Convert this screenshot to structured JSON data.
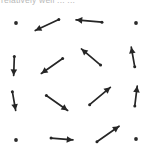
{
  "figure": {
    "title_fragment": "relatively well ... ...",
    "width": 154,
    "height": 159,
    "background_color": "#ffffff",
    "arrow_color": "#262626",
    "dot_color": "#2b2b2b",
    "caption_color": "#b9b9b9"
  },
  "chart_data": {
    "type": "scatter",
    "title": "relatively well ... ...",
    "xlabel": "",
    "ylabel": "",
    "grid": false,
    "legend": null,
    "xlim": [
      0,
      4
    ],
    "ylim": [
      0,
      4
    ],
    "columns": 4,
    "rows": 4,
    "markers": [
      {
        "id": "r1c1",
        "row": 1,
        "col": 1,
        "x": 16,
        "y": 23,
        "kind": "dot",
        "direction": "none",
        "angle_deg": null,
        "length": 0,
        "label": "stationary-point"
      },
      {
        "id": "r1c2",
        "row": 1,
        "col": 2,
        "x": 47,
        "y": 25,
        "kind": "arrow",
        "direction": "down-left",
        "angle_deg": 205,
        "length": 26,
        "label": "vector-down-left"
      },
      {
        "id": "r1c3",
        "row": 1,
        "col": 3,
        "x": 89,
        "y": 21,
        "kind": "arrow",
        "direction": "left",
        "angle_deg": 175,
        "length": 26,
        "label": "vector-left"
      },
      {
        "id": "r1c4",
        "row": 1,
        "col": 4,
        "x": 136,
        "y": 23,
        "kind": "dot",
        "direction": "none",
        "angle_deg": null,
        "length": 0,
        "label": "stationary-point"
      },
      {
        "id": "r2c1",
        "row": 2,
        "col": 1,
        "x": 14,
        "y": 66,
        "kind": "arrow",
        "direction": "down",
        "angle_deg": 268,
        "length": 19,
        "label": "vector-down"
      },
      {
        "id": "r2c2",
        "row": 2,
        "col": 2,
        "x": 52,
        "y": 66,
        "kind": "arrow",
        "direction": "down-left",
        "angle_deg": 215,
        "length": 26,
        "label": "vector-down-left"
      },
      {
        "id": "r2c3",
        "row": 2,
        "col": 3,
        "x": 91,
        "y": 57,
        "kind": "arrow",
        "direction": "up-left",
        "angle_deg": 140,
        "length": 25,
        "label": "vector-up-left"
      },
      {
        "id": "r2c4",
        "row": 2,
        "col": 4,
        "x": 133,
        "y": 57,
        "kind": "arrow",
        "direction": "up",
        "angle_deg": 100,
        "length": 20,
        "label": "vector-up"
      },
      {
        "id": "r3c1",
        "row": 3,
        "col": 1,
        "x": 14,
        "y": 101,
        "kind": "arrow",
        "direction": "down",
        "angle_deg": 280,
        "length": 19,
        "label": "vector-down"
      },
      {
        "id": "r3c2",
        "row": 3,
        "col": 2,
        "x": 57,
        "y": 103,
        "kind": "arrow",
        "direction": "down-right",
        "angle_deg": 325,
        "length": 26,
        "label": "vector-down-right"
      },
      {
        "id": "r3c3",
        "row": 3,
        "col": 3,
        "x": 100,
        "y": 96,
        "kind": "arrow",
        "direction": "up-right",
        "angle_deg": 40,
        "length": 27,
        "label": "vector-up-right"
      },
      {
        "id": "r3c4",
        "row": 3,
        "col": 4,
        "x": 136,
        "y": 96,
        "kind": "arrow",
        "direction": "up",
        "angle_deg": 83,
        "length": 20,
        "label": "vector-up"
      },
      {
        "id": "r4c1",
        "row": 4,
        "col": 1,
        "x": 16,
        "y": 140,
        "kind": "dot",
        "direction": "none",
        "angle_deg": null,
        "length": 0,
        "label": "stationary-point"
      },
      {
        "id": "r4c2",
        "row": 4,
        "col": 2,
        "x": 62,
        "y": 139,
        "kind": "arrow",
        "direction": "right",
        "angle_deg": 355,
        "length": 22,
        "label": "vector-right"
      },
      {
        "id": "r4c3",
        "row": 4,
        "col": 3,
        "x": 108,
        "y": 134,
        "kind": "arrow",
        "direction": "up-right",
        "angle_deg": 35,
        "length": 27,
        "label": "vector-up-right"
      },
      {
        "id": "r4c4",
        "row": 4,
        "col": 4,
        "x": 136,
        "y": 139,
        "kind": "dot",
        "direction": "none",
        "angle_deg": null,
        "length": 0,
        "label": "stationary-point"
      }
    ]
  }
}
